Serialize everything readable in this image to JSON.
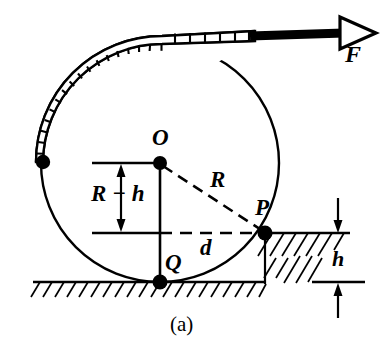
{
  "figure": {
    "caption": "(a)",
    "type": "physics-free-body-diagram",
    "labels": {
      "center_point": "O",
      "contact_point_step": "P",
      "contact_point_ground": "Q",
      "radius": "R",
      "horizontal_distance": "d",
      "force": "F",
      "step_height": "h",
      "vertical_offset": "R − h"
    },
    "colors": {
      "stroke": "#000000",
      "background": "#ffffff",
      "fill_band": "#ffffff",
      "fill_arrowhead": "#ffffff"
    },
    "geometry": {
      "center_x": 160,
      "center_y": 163,
      "radius": 119,
      "ground_lower_y": 282,
      "ground_upper_y": 233,
      "point_P_x": 265,
      "point_P_y": 233,
      "point_Q_x": 160,
      "point_Q_y": 282,
      "band_end_dot_x": 43,
      "band_end_dot_y": 162,
      "force_arrow_tip_x": 372,
      "force_arrow_y": 33
    }
  }
}
